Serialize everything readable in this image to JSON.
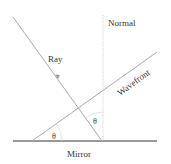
{
  "diagram": {
    "labels": {
      "ray": "Ray",
      "normal": "Normal",
      "wavefront": "Wavefront",
      "mirror": "Mirror",
      "angle_wavefront": "θ",
      "angle_normal": "θ"
    },
    "colors": {
      "mirror": "#333333",
      "lines": "#b0b0b0",
      "normal": "#c8c8c8",
      "text": "#333333"
    }
  }
}
